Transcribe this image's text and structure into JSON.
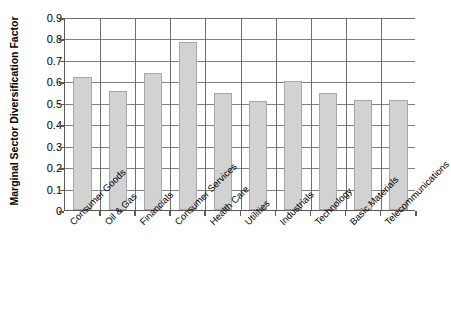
{
  "chart_data": {
    "type": "bar",
    "title": "",
    "xlabel": "",
    "ylabel": "Marginal Sector Diversification Factor",
    "ylim": [
      0,
      0.9
    ],
    "ytick_labels": [
      "0",
      "0.1",
      "0.2",
      "0.3",
      "0.4",
      "0.5",
      "0.6",
      "0.7",
      "0.8",
      "0.9"
    ],
    "ytick_values": [
      0,
      0.1,
      0.2,
      0.3,
      0.4,
      0.5,
      0.6,
      0.7,
      0.8,
      0.9
    ],
    "grid": true,
    "legend": false,
    "bar_color": "#d2d2d2",
    "bar_edge_color": "#a8a8a8",
    "axis_color": "#5a5a5a",
    "grid_color": "#808080",
    "categories": [
      "Consumer Goods",
      "Oil & Gas",
      "Financials",
      "Consumer Services",
      "Health Care",
      "Utilities",
      "Industrials",
      "Technology",
      "Basic Materials",
      "Telecommunications"
    ],
    "values": [
      0.62,
      0.555,
      0.64,
      0.785,
      0.545,
      0.51,
      0.6,
      0.545,
      0.515,
      0.515
    ]
  }
}
